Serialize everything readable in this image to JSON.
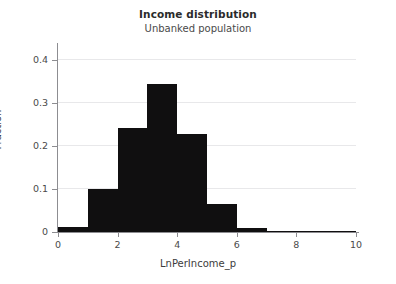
{
  "chart_data": {
    "type": "bar",
    "title": "Income distribution",
    "subtitle": "Unbanked population",
    "xlabel": "LnPerIncome_p",
    "ylabel": "Fraction",
    "xlim": [
      0,
      10
    ],
    "ylim": [
      0,
      0.43
    ],
    "grid": "horizontal",
    "legend": "none",
    "bin_width": 1,
    "bar_color": "#100f10",
    "grid_color": "#e8e8ea",
    "axis_color": "#8d8d91",
    "background_color": "#ffffff",
    "x_tick_labels": [
      "0",
      "2",
      "4",
      "6",
      "8",
      "10"
    ],
    "x_tick_values": [
      0,
      2,
      4,
      6,
      8,
      10
    ],
    "y_tick_labels": [
      "0",
      "0.1",
      "0.2",
      "0.3",
      "0.4"
    ],
    "y_tick_values": [
      0,
      0.1,
      0.2,
      0.3,
      0.4
    ],
    "categories": [
      "0-1",
      "1-2",
      "2-3",
      "3-4",
      "4-5",
      "5-6",
      "6-7",
      "7-8",
      "8-9",
      "9-10"
    ],
    "bin_starts": [
      0,
      1,
      2,
      3,
      4,
      5,
      6,
      7,
      8,
      9
    ],
    "values": [
      0.012,
      0.1,
      0.241,
      0.343,
      0.227,
      0.066,
      0.009,
      0.002,
      0.001,
      0.001
    ]
  }
}
